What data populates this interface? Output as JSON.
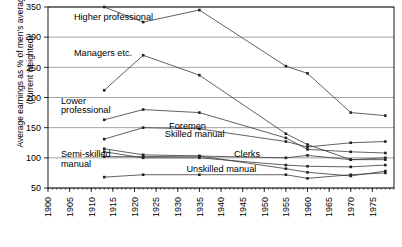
{
  "chart_data": {
    "type": "line",
    "title": "",
    "xlabel": "",
    "ylabel": "Average earnings as % of men's average\n(current weighted)",
    "xlim": [
      1900,
      1980
    ],
    "ylim": [
      50,
      350
    ],
    "ytick_values": [
      50,
      100,
      150,
      200,
      250,
      300,
      350
    ],
    "ytick_labels": [
      "50",
      "100",
      "150",
      "200",
      "250",
      "300",
      "350"
    ],
    "xtick_values": [
      1900,
      1905,
      1910,
      1915,
      1920,
      1925,
      1930,
      1935,
      1940,
      1945,
      1950,
      1955,
      1960,
      1965,
      1970,
      1975
    ],
    "xtick_labels": [
      "1900",
      "1905",
      "1910",
      "1915",
      "1920",
      "1925",
      "1930",
      "1935",
      "1940",
      "1945",
      "1950",
      "1955",
      "1960",
      "1965",
      "1970",
      "1975"
    ],
    "grid": true,
    "legend_position": "inline-annotations",
    "series": [
      {
        "name": "Higher professional",
        "label_x": 1906,
        "label_y": 328,
        "x": [
          1913,
          1922,
          1935,
          1955,
          1960,
          1970,
          1978
        ],
        "values": [
          350,
          325,
          345,
          252,
          240,
          175,
          170
        ]
      },
      {
        "name": "Managers etc.",
        "label_x": 1906,
        "label_y": 268,
        "x": [
          1913,
          1922,
          1935,
          1955,
          1960,
          1970,
          1978
        ],
        "values": [
          212,
          270,
          237,
          140,
          122,
          97,
          100
        ]
      },
      {
        "name": "Lower professional",
        "label_x": 1903,
        "label_y": 190,
        "x": [
          1913,
          1922,
          1935,
          1955,
          1960,
          1970,
          1978
        ],
        "values": [
          163,
          180,
          175,
          133,
          114,
          110,
          108
        ]
      },
      {
        "name": "Foremen",
        "label_x": 1928,
        "label_y": 147,
        "x": [
          1913,
          1922,
          1935,
          1955,
          1960,
          1970,
          1978
        ],
        "values": [
          131,
          150,
          148,
          127,
          118,
          125,
          127
        ]
      },
      {
        "name": "Skilled manual",
        "label_x": 1927,
        "label_y": 135,
        "x": [
          1913,
          1922,
          1935,
          1955,
          1960,
          1970,
          1978
        ],
        "values": [
          115,
          105,
          103,
          100,
          104,
          97,
          97
        ]
      },
      {
        "name": "Semi-skilled manual",
        "label_x": 1903,
        "label_y": 101,
        "x": [
          1913,
          1922,
          1935,
          1955,
          1960,
          1970,
          1978
        ],
        "values": [
          110,
          100,
          100,
          88,
          86,
          85,
          88
        ]
      },
      {
        "name": "Clerks",
        "label_x": 1943,
        "label_y": 101,
        "x": [
          1913,
          1922,
          1935,
          1955,
          1960,
          1970,
          1978
        ],
        "values": [
          102,
          102,
          103,
          82,
          76,
          70,
          78
        ]
      },
      {
        "name": "Unskilled manual",
        "label_x": 1932,
        "label_y": 77,
        "x": [
          1913,
          1922,
          1935,
          1955,
          1960,
          1970,
          1978
        ],
        "values": [
          68,
          72,
          72,
          72,
          66,
          72,
          75
        ]
      }
    ],
    "colors": {
      "line": "#3a3a3a",
      "grid": "#8a8a8a",
      "frame": "#000000",
      "marker": "#222222"
    }
  }
}
